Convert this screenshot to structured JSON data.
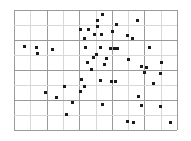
{
  "chart_data": {
    "type": "scatter",
    "title": "",
    "subtitle": "",
    "xlabel": "",
    "ylabel": "",
    "xlim": [
      0,
      10
    ],
    "ylim": [
      0,
      8
    ],
    "grid": true,
    "grid_color": "#9a9a9a",
    "grid_faint_color": "#d8d8d8",
    "background": "#ffffff",
    "marker_color": "#1a1a1a",
    "marker_shape": "square",
    "marker_size_px": 3,
    "legend": null,
    "legend_position": "none",
    "xticklabels": [],
    "yticklabels": [],
    "annotations": [],
    "x_gridlines": [
      0,
      1,
      2,
      3,
      4,
      5,
      6,
      7,
      8,
      9,
      10
    ],
    "y_gridlines": [
      0,
      1,
      2,
      3,
      4,
      5,
      6,
      7,
      8
    ],
    "n_points": 58,
    "points": [
      {
        "x": 5.4,
        "y": 7.72
      },
      {
        "x": 5.1,
        "y": 7.3
      },
      {
        "x": 7.55,
        "y": 7.28
      },
      {
        "x": 6.3,
        "y": 7.05
      },
      {
        "x": 5.15,
        "y": 6.92
      },
      {
        "x": 4.05,
        "y": 6.72
      },
      {
        "x": 4.6,
        "y": 6.7
      },
      {
        "x": 6.05,
        "y": 6.55
      },
      {
        "x": 4.95,
        "y": 6.4
      },
      {
        "x": 5.35,
        "y": 6.36
      },
      {
        "x": 6.95,
        "y": 6.28
      },
      {
        "x": 4.35,
        "y": 6.12
      },
      {
        "x": 7.3,
        "y": 6.08
      },
      {
        "x": 0.65,
        "y": 5.55
      },
      {
        "x": 1.4,
        "y": 5.48
      },
      {
        "x": 2.35,
        "y": 5.4
      },
      {
        "x": 4.4,
        "y": 5.52
      },
      {
        "x": 5.3,
        "y": 5.48
      },
      {
        "x": 8.3,
        "y": 5.5
      },
      {
        "x": 5.95,
        "y": 5.42
      },
      {
        "x": 6.15,
        "y": 5.42
      },
      {
        "x": 6.35,
        "y": 5.42
      },
      {
        "x": 1.45,
        "y": 5.08
      },
      {
        "x": 5.05,
        "y": 5.05
      },
      {
        "x": 4.9,
        "y": 4.85
      },
      {
        "x": 5.7,
        "y": 4.78
      },
      {
        "x": 7.05,
        "y": 4.7
      },
      {
        "x": 4.5,
        "y": 4.52
      },
      {
        "x": 5.55,
        "y": 4.4
      },
      {
        "x": 9.05,
        "y": 4.48
      },
      {
        "x": 7.85,
        "y": 4.22
      },
      {
        "x": 8.15,
        "y": 4.15
      },
      {
        "x": 4.75,
        "y": 4.05
      },
      {
        "x": 8.0,
        "y": 3.85
      },
      {
        "x": 9.0,
        "y": 3.78
      },
      {
        "x": 4.15,
        "y": 3.4
      },
      {
        "x": 5.3,
        "y": 3.3
      },
      {
        "x": 6.0,
        "y": 3.22
      },
      {
        "x": 6.25,
        "y": 3.22
      },
      {
        "x": 8.55,
        "y": 3.1
      },
      {
        "x": 3.1,
        "y": 2.92
      },
      {
        "x": 4.35,
        "y": 2.88
      },
      {
        "x": 4.05,
        "y": 2.6
      },
      {
        "x": 1.95,
        "y": 2.48
      },
      {
        "x": 2.6,
        "y": 2.2
      },
      {
        "x": 7.65,
        "y": 2.25
      },
      {
        "x": 3.6,
        "y": 1.85
      },
      {
        "x": 5.45,
        "y": 1.72
      },
      {
        "x": 7.85,
        "y": 1.62
      },
      {
        "x": 9.0,
        "y": 1.55
      },
      {
        "x": 3.25,
        "y": 1.05
      },
      {
        "x": 6.95,
        "y": 0.6
      },
      {
        "x": 7.35,
        "y": 0.48
      },
      {
        "x": 9.6,
        "y": 0.52
      }
    ]
  },
  "figure": {
    "width_px": 191,
    "height_px": 141,
    "plot_left_px": 14,
    "plot_top_px": 10,
    "plot_width_px": 163,
    "plot_height_px": 120
  }
}
